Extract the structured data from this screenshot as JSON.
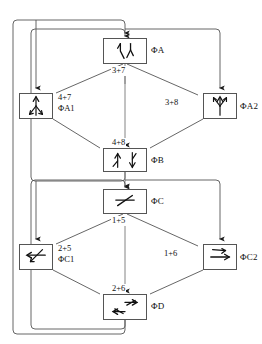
{
  "diagram": {
    "stroke_color": "#555555",
    "text_color": "#111111",
    "background": "#ffffff",
    "nodes": [
      {
        "id": "PhiA",
        "label": "ΦA",
        "glyph": "two-slanted-strokes-icon",
        "x": 103,
        "y": 38,
        "w": 44,
        "h": 26
      },
      {
        "id": "PhiA1",
        "label": "ΦA1",
        "glyph": "upward-branch-arrows-icon",
        "x": 19,
        "y": 93,
        "w": 34,
        "h": 26
      },
      {
        "id": "PhiA2",
        "label": "ΦA2",
        "glyph": "y-fork-up-arrows-icon",
        "x": 203,
        "y": 93,
        "w": 34,
        "h": 26
      },
      {
        "id": "PhiB",
        "label": "ΦB",
        "glyph": "two-vertical-arrow-pair-icon",
        "x": 103,
        "y": 148,
        "w": 44,
        "h": 24
      },
      {
        "id": "PhiC",
        "label": "ΦC",
        "glyph": "horizontal-line-slash-icon",
        "x": 103,
        "y": 189,
        "w": 44,
        "h": 25
      },
      {
        "id": "PhiC1",
        "label": "ΦC1",
        "glyph": "left-pointing-fork-icon",
        "x": 19,
        "y": 244,
        "w": 34,
        "h": 26
      },
      {
        "id": "PhiC2",
        "label": "ΦC2",
        "glyph": "right-pointing-fork-icon",
        "x": 203,
        "y": 244,
        "w": 34,
        "h": 26
      },
      {
        "id": "PhiD",
        "label": "ΦD",
        "glyph": "two-horizontal-arrows-icon",
        "x": 103,
        "y": 294,
        "w": 44,
        "h": 26
      }
    ],
    "edge_labels": [
      {
        "id": "a-out",
        "text": "3+7",
        "x": 111,
        "y": 66
      },
      {
        "id": "a1-in",
        "text": "4+7",
        "x": 57,
        "y": 93
      },
      {
        "id": "a1-name",
        "text": "ΦA1",
        "x": 57,
        "y": 104
      },
      {
        "id": "a2-in",
        "text": "3+8",
        "x": 164,
        "y": 98
      },
      {
        "id": "b-in",
        "text": "4+8",
        "x": 111,
        "y": 138
      },
      {
        "id": "c-out",
        "text": "1+5",
        "x": 111,
        "y": 216
      },
      {
        "id": "c1-in",
        "text": "2+5",
        "x": 57,
        "y": 244
      },
      {
        "id": "c1-name",
        "text": "ΦC1",
        "x": 57,
        "y": 255
      },
      {
        "id": "c2-in",
        "text": "1+6",
        "x": 163,
        "y": 249
      },
      {
        "id": "d-in",
        "text": "2+6",
        "x": 111,
        "y": 284
      }
    ],
    "node_labels": [
      {
        "id": "lbl-PhiA",
        "text": "ΦA",
        "x": 151,
        "y": 45
      },
      {
        "id": "lbl-PhiA2",
        "text": "ΦA2",
        "x": 240,
        "y": 101
      },
      {
        "id": "lbl-PhiB",
        "text": "ΦB",
        "x": 151,
        "y": 155
      },
      {
        "id": "lbl-PhiC",
        "text": "ΦC",
        "x": 151,
        "y": 196
      },
      {
        "id": "lbl-PhiC2",
        "text": "ΦC2",
        "x": 240,
        "y": 252
      },
      {
        "id": "lbl-PhiD",
        "text": "ΦD",
        "x": 151,
        "y": 301
      }
    ]
  }
}
